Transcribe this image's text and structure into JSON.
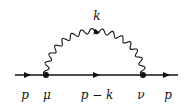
{
  "diagram": {
    "type": "feynman-self-energy",
    "labels": {
      "photon_momentum": "k",
      "incoming_momentum": "p",
      "vertex_left": "μ",
      "internal_momentum": "p − k",
      "vertex_right": "ν",
      "outgoing_momentum": "p"
    },
    "colors": {
      "line": "#111111",
      "background": "#ffffff"
    }
  }
}
